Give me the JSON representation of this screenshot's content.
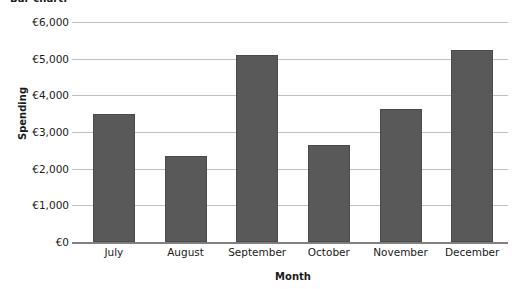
{
  "chart_data": {
    "type": "bar",
    "title": "Bar chart:",
    "xlabel": "Month",
    "ylabel": "Spending",
    "categories": [
      "July",
      "August",
      "September",
      "October",
      "November",
      "December"
    ],
    "values": [
      3500,
      2350,
      5100,
      2650,
      3630,
      5250
    ],
    "ylim": [
      0,
      6000
    ],
    "ytick_values": [
      0,
      1000,
      2000,
      3000,
      4000,
      5000,
      6000
    ],
    "ytick_labels": [
      "€0",
      "€1,000",
      "€2,000",
      "€3,000",
      "€4,000",
      "€5,000",
      "€6,000"
    ],
    "grid": true,
    "legend": false,
    "bar_color": "#595959",
    "gridline_color": "#c0c0c0",
    "axis_color": "#808080",
    "currency_symbol": "€"
  }
}
